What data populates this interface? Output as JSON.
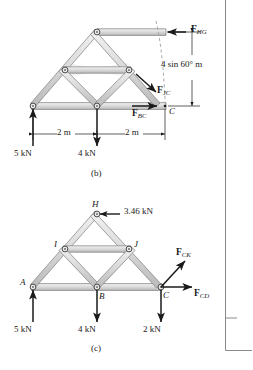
{
  "figure": {
    "colors": {
      "member_fill": "#d9d9d9",
      "member_stroke": "#7d7d7d",
      "line": "#1a1a1a",
      "dashed": "#9a9a9a",
      "page_rule": "#8a8a8a",
      "background": "#ffffff"
    },
    "page_rules": {
      "vertical_x": 225,
      "horizontal_y": 350,
      "tick_y": 318
    }
  },
  "panels": [
    {
      "id": "b",
      "caption": "(b)",
      "joints": [
        {
          "name": "apex-H",
          "x": 97,
          "y": 32
        },
        {
          "name": "left-mid-I",
          "x": 65,
          "y": 70
        },
        {
          "name": "right-mid-J",
          "x": 129,
          "y": 70
        },
        {
          "name": "left-support-A",
          "x": 33,
          "y": 106
        },
        {
          "name": "bottom-mid-B",
          "x": 97,
          "y": 106
        }
      ],
      "section_point": {
        "label": "C",
        "x": 165,
        "y": 106
      },
      "forces": [
        {
          "name": "F_HG",
          "base": "F",
          "sub": "HG",
          "dir": "left",
          "at": [
            165,
            32
          ]
        },
        {
          "name": "F_JC",
          "base": "F",
          "sub": "JC",
          "dir": "down-right",
          "at": [
            148,
            86
          ]
        },
        {
          "name": "F_BC",
          "base": "F",
          "sub": "BC",
          "dir": "right",
          "at": [
            150,
            106
          ]
        }
      ],
      "loads": [
        {
          "label": "5 kN",
          "dir": "up",
          "x": 33
        },
        {
          "label": "4 kN",
          "dir": "down",
          "x": 97
        }
      ],
      "dimensions": [
        {
          "label": "2 m",
          "from_x": 33,
          "to_x": 97,
          "y": 134
        },
        {
          "label": "2 m",
          "from_x": 97,
          "to_x": 165,
          "y": 134
        },
        {
          "label": "4 sin 60° m",
          "x": 192,
          "from_y": 32,
          "to_y": 106
        }
      ]
    },
    {
      "id": "c",
      "caption": "(c)",
      "joints": [
        {
          "name": "apex-H",
          "label": "H",
          "x": 97,
          "y": 214
        },
        {
          "name": "left-mid-I",
          "label": "I",
          "x": 65,
          "y": 249
        },
        {
          "name": "right-mid-J",
          "label": "J",
          "x": 129,
          "y": 249
        },
        {
          "name": "support-A",
          "label": "A",
          "x": 33,
          "y": 287
        },
        {
          "name": "bottom-mid-B",
          "label": "B",
          "x": 97,
          "y": 287
        },
        {
          "name": "node-C",
          "label": "C",
          "x": 161,
          "y": 287
        }
      ],
      "forces": [
        {
          "name": "load-H",
          "label": "3.46 kN",
          "dir": "left",
          "at": [
            97,
            214
          ]
        },
        {
          "name": "F_CK",
          "base": "F",
          "sub": "CK",
          "dir": "up-right",
          "at": [
            161,
            287
          ]
        },
        {
          "name": "F_CD",
          "base": "F",
          "sub": "CD",
          "dir": "right",
          "at": [
            161,
            287
          ]
        }
      ],
      "loads": [
        {
          "label": "5 kN",
          "dir": "up",
          "x": 33
        },
        {
          "label": "4 kN",
          "dir": "down",
          "x": 97
        },
        {
          "label": "2 kN",
          "dir": "down",
          "x": 161
        }
      ]
    }
  ]
}
